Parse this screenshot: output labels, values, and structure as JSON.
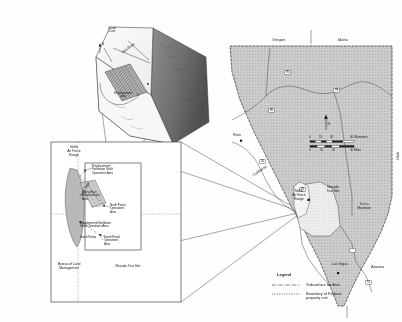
{
  "figure": {
    "type": "multi-panel-location-map",
    "background_color": "#fefefe",
    "ink_color": "#111111",
    "state_fill": "#c9c9c9",
    "highlight_fill": "#e8e8e8",
    "block_fill": "#9a9a9a"
  },
  "block_diagram": {
    "name": "three-dimensional block diagram",
    "labels": {
      "canal_crest": "Canal\nCrest",
      "drift_ramp": "Main Ramp",
      "emplacement_area": "Emplacement\narea",
      "north_arrow": "N"
    }
  },
  "site_inset": {
    "name": "nellis-nevada-test-site-inset",
    "labels": {
      "nellis": "Nellis\nAir Force\nRange",
      "nevada_test_site": "Nevada Test Site",
      "blm": "Bureau of Land\nManagement",
      "emplacement_shaft": "Emplacement/\nVentilation Shaft\nOperations Area",
      "subsurface": "Subsurface\nEmplacement\nArea",
      "north_portal": "North Portal\nOperations\nArea",
      "decon_shaft": "Development/Ventilation\nShaft Operations Area",
      "south_ramp": "South Ramp",
      "south_portal": "South Portal\nOperations\nArea",
      "yucca_ridge": "Yucca Ridge"
    }
  },
  "nevada_map": {
    "name": "state-of-nevada-map",
    "states": {
      "oregon": "Oregon",
      "idaho": "Idaho",
      "california": "California",
      "arizona": "Arizona",
      "utah": "Utah"
    },
    "cities": [
      {
        "label": "Reno"
      },
      {
        "label": "Las Vegas"
      }
    ],
    "places": [
      {
        "label": "Nellis\nAir Force\nRange"
      },
      {
        "label": "Nevada\nTest Site"
      },
      {
        "label": "Yucca\nMountain"
      }
    ],
    "highways": [
      "95",
      "80",
      "93",
      "50",
      "95",
      "15"
    ],
    "north_arrow": "N",
    "scale_bar": {
      "km_ticks": [
        "0",
        "15",
        "30",
        "60"
      ],
      "km_unit": "60 Kilometers",
      "mi_ticks": [
        "0",
        "10",
        "20"
      ],
      "mi_unit": "40 Miles"
    }
  },
  "legend": {
    "title": "Legend",
    "items": [
      {
        "label": "Subsurface facilities",
        "style": "dash-dot"
      },
      {
        "label": "Boundary of Federal\nproperty unit",
        "style": "dotted"
      }
    ]
  }
}
